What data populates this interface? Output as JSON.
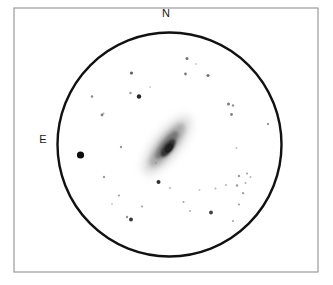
{
  "figure": {
    "kind": "astronomical-eyepiece-sketch",
    "background_color": "#ffffff",
    "width": 333,
    "height": 285
  },
  "frame": {
    "name": "outer-border",
    "x": 14,
    "y": 8,
    "width": 304,
    "height": 264,
    "stroke_color": "#9a9a9a",
    "stroke_width": 1.2,
    "fill_color": "#ffffff"
  },
  "field_of_view": {
    "name": "eyepiece-field-circle",
    "center_x": 169.5,
    "center_y": 144.5,
    "radius": 112,
    "stroke_color": "#111111",
    "stroke_width": 2.4,
    "fill_color": "#ffffff"
  },
  "cardinal_labels": [
    {
      "id": "north",
      "text": "N",
      "x": 166,
      "y": 14,
      "font_size": 11
    },
    {
      "id": "east",
      "text": "E",
      "x": 43,
      "y": 140,
      "font_size": 11
    }
  ],
  "galaxy": {
    "name": "edge-on-galaxy",
    "center_x": 167,
    "center_y": 145,
    "position_angle_deg": -52,
    "halo": {
      "rx": 36,
      "ry": 13,
      "color": "#8e8e8e",
      "opacity": 0.3,
      "blur": 4.2
    },
    "disk": {
      "rx": 27,
      "ry": 8.5,
      "color": "#6e6e6e",
      "opacity": 0.48,
      "blur": 2.6
    },
    "inner_disk": {
      "rx": 17,
      "ry": 5.5,
      "color": "#4a4a4a",
      "opacity": 0.55,
      "blur": 1.8
    },
    "core": {
      "offset_x": 1,
      "offset_y": 3,
      "rx": 10.5,
      "ry": 4.6,
      "color": "#2a2a2a",
      "opacity": 0.92,
      "blur": 0.9
    },
    "nucleus": {
      "offset_x": 2,
      "offset_y": 3,
      "rx": 5.5,
      "ry": 3.2,
      "color": "#1a1a1a",
      "opacity": 0.95,
      "blur": 0.5
    }
  },
  "stars": [
    {
      "x": 80.5,
      "y": 155.0,
      "r": 3.6,
      "color": "#0d0d0d",
      "opacity": 1.0
    },
    {
      "x": 139.0,
      "y": 96.5,
      "r": 2.2,
      "color": "#1c1c1c",
      "opacity": 0.95
    },
    {
      "x": 158.5,
      "y": 182.0,
      "r": 2.0,
      "color": "#1f1f1f",
      "opacity": 0.92
    },
    {
      "x": 131.0,
      "y": 219.5,
      "r": 2.0,
      "color": "#242424",
      "opacity": 0.9
    },
    {
      "x": 211.0,
      "y": 212.5,
      "r": 1.9,
      "color": "#262626",
      "opacity": 0.88
    },
    {
      "x": 131.5,
      "y": 73.0,
      "r": 1.6,
      "color": "#3a3a3a",
      "opacity": 0.8
    },
    {
      "x": 187.0,
      "y": 58.5,
      "r": 1.5,
      "color": "#454545",
      "opacity": 0.75
    },
    {
      "x": 185.5,
      "y": 74.0,
      "r": 1.4,
      "color": "#4c4c4c",
      "opacity": 0.72
    },
    {
      "x": 208.0,
      "y": 75.5,
      "r": 1.5,
      "color": "#434343",
      "opacity": 0.76
    },
    {
      "x": 228.5,
      "y": 104.0,
      "r": 1.5,
      "color": "#4a4a4a",
      "opacity": 0.72
    },
    {
      "x": 233.0,
      "y": 105.5,
      "r": 1.2,
      "color": "#585858",
      "opacity": 0.65
    },
    {
      "x": 231.5,
      "y": 114.5,
      "r": 1.4,
      "color": "#4e4e4e",
      "opacity": 0.7
    },
    {
      "x": 130.5,
      "y": 93.0,
      "r": 1.2,
      "color": "#5a5a5a",
      "opacity": 0.62
    },
    {
      "x": 102.0,
      "y": 115.0,
      "r": 1.4,
      "color": "#4f4f4f",
      "opacity": 0.7
    },
    {
      "x": 92.0,
      "y": 96.5,
      "r": 1.3,
      "color": "#565656",
      "opacity": 0.66
    },
    {
      "x": 103.5,
      "y": 113.5,
      "r": 1.0,
      "color": "#6a6a6a",
      "opacity": 0.55
    },
    {
      "x": 121.0,
      "y": 147.0,
      "r": 1.2,
      "color": "#5c5c5c",
      "opacity": 0.62
    },
    {
      "x": 104.0,
      "y": 177.0,
      "r": 1.2,
      "color": "#5e5e5e",
      "opacity": 0.6
    },
    {
      "x": 119.0,
      "y": 195.5,
      "r": 1.1,
      "color": "#646464",
      "opacity": 0.58
    },
    {
      "x": 127.0,
      "y": 217.0,
      "r": 1.2,
      "color": "#555555",
      "opacity": 0.64
    },
    {
      "x": 142.0,
      "y": 206.5,
      "r": 1.1,
      "color": "#636363",
      "opacity": 0.58
    },
    {
      "x": 170.0,
      "y": 188.0,
      "r": 1.0,
      "color": "#6c6c6c",
      "opacity": 0.52
    },
    {
      "x": 183.5,
      "y": 202.0,
      "r": 1.1,
      "color": "#646464",
      "opacity": 0.56
    },
    {
      "x": 190.0,
      "y": 211.0,
      "r": 1.0,
      "color": "#6b6b6b",
      "opacity": 0.52
    },
    {
      "x": 239.0,
      "y": 176.0,
      "r": 1.2,
      "color": "#5d5d5d",
      "opacity": 0.6
    },
    {
      "x": 247.0,
      "y": 173.5,
      "r": 1.1,
      "color": "#636363",
      "opacity": 0.57
    },
    {
      "x": 237.0,
      "y": 185.5,
      "r": 1.2,
      "color": "#5b5b5b",
      "opacity": 0.61
    },
    {
      "x": 245.5,
      "y": 183.0,
      "r": 1.0,
      "color": "#6a6a6a",
      "opacity": 0.53
    },
    {
      "x": 250.5,
      "y": 177.0,
      "r": 1.0,
      "color": "#6d6d6d",
      "opacity": 0.51
    },
    {
      "x": 243.0,
      "y": 193.0,
      "r": 1.1,
      "color": "#626262",
      "opacity": 0.57
    },
    {
      "x": 226.0,
      "y": 185.0,
      "r": 1.0,
      "color": "#6e6e6e",
      "opacity": 0.5
    },
    {
      "x": 239.0,
      "y": 204.5,
      "r": 1.1,
      "color": "#5f5f5f",
      "opacity": 0.58
    },
    {
      "x": 233.0,
      "y": 221.0,
      "r": 1.1,
      "color": "#5f5f5f",
      "opacity": 0.57
    },
    {
      "x": 215.5,
      "y": 188.5,
      "r": 1.0,
      "color": "#6b6b6b",
      "opacity": 0.52
    },
    {
      "x": 199.5,
      "y": 190.0,
      "r": 0.9,
      "color": "#747474",
      "opacity": 0.46
    },
    {
      "x": 268.0,
      "y": 124.0,
      "r": 1.2,
      "color": "#5c5c5c",
      "opacity": 0.6
    },
    {
      "x": 236.5,
      "y": 148.0,
      "r": 0.9,
      "color": "#757575",
      "opacity": 0.45
    },
    {
      "x": 243.5,
      "y": 193.5,
      "r": 0.9,
      "color": "#767676",
      "opacity": 0.44
    },
    {
      "x": 156.0,
      "y": 163.0,
      "r": 0.9,
      "color": "#787878",
      "opacity": 0.42
    },
    {
      "x": 112.0,
      "y": 204.0,
      "r": 0.9,
      "color": "#787878",
      "opacity": 0.42
    },
    {
      "x": 196.0,
      "y": 64.0,
      "r": 0.9,
      "color": "#7a7a7a",
      "opacity": 0.4
    },
    {
      "x": 150.0,
      "y": 87.0,
      "r": 0.9,
      "color": "#7a7a7a",
      "opacity": 0.4
    }
  ]
}
